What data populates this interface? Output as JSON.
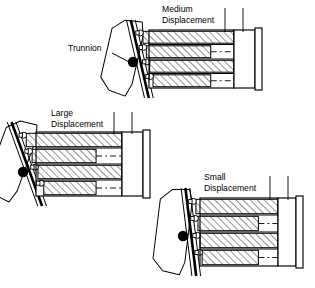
{
  "figure": {
    "type": "technical-cross-section-diagram",
    "background_color": "#ffffff",
    "line_color": "#000000",
    "hatch_color": "#000000",
    "accent_color": "#000000",
    "width": 315,
    "height": 288
  },
  "callouts": [
    {
      "id": "trunnion",
      "label": "Trunnion",
      "label_x": 68,
      "label_y": 51,
      "leader_from_x": 112,
      "leader_from_y": 53,
      "leader_to_x": 131,
      "leader_to_y": 63
    }
  ],
  "assemblies": [
    {
      "id": "medium",
      "name": "medium-displacement-assembly",
      "label_line1": "Medium",
      "label_line2": "Displacement",
      "label_x": 162,
      "label_y": 12,
      "tilt_deg": 13,
      "origin_x": 118,
      "origin_y": 26,
      "block_left": 149,
      "block_right": 234,
      "block_top": 30,
      "block_bottom": 88,
      "port_plate_left": 234,
      "port_plate_right": 262,
      "piston_count": 4,
      "leaders": [
        {
          "x": 225,
          "y_top": 8,
          "y_bottom": 32
        },
        {
          "x": 243,
          "y_top": 8,
          "y_bottom": 32
        }
      ],
      "trunnion": {
        "cx": 133,
        "cy": 62,
        "r": 5.2
      }
    },
    {
      "id": "large",
      "name": "large-displacement-assembly",
      "label_line1": "Large",
      "label_line2": "Displacement",
      "label_x": 51,
      "label_y": 116,
      "tilt_deg": 20,
      "origin_x": 10,
      "origin_y": 128,
      "block_left": 36,
      "block_right": 122,
      "block_top": 132,
      "block_bottom": 196,
      "port_plate_left": 122,
      "port_plate_right": 150,
      "piston_count": 4,
      "leaders": [
        {
          "x": 114,
          "y_top": 112,
          "y_bottom": 134
        },
        {
          "x": 132,
          "y_top": 112,
          "y_bottom": 134
        }
      ],
      "trunnion": {
        "cx": 23,
        "cy": 172,
        "r": 5.2
      }
    },
    {
      "id": "small",
      "name": "small-displacement-assembly",
      "label_line1": "Small",
      "label_line2": "Displacement",
      "label_x": 204,
      "label_y": 180,
      "tilt_deg": 7,
      "origin_x": 170,
      "origin_y": 194,
      "block_left": 200,
      "block_right": 278,
      "block_top": 198,
      "block_bottom": 266,
      "port_plate_left": 278,
      "port_plate_right": 303,
      "piston_count": 4,
      "leaders": [
        {
          "x": 270,
          "y_top": 176,
          "y_bottom": 200
        },
        {
          "x": 288,
          "y_top": 176,
          "y_bottom": 200
        }
      ],
      "trunnion": {
        "cx": 183,
        "cy": 236,
        "r": 5.2
      }
    }
  ]
}
